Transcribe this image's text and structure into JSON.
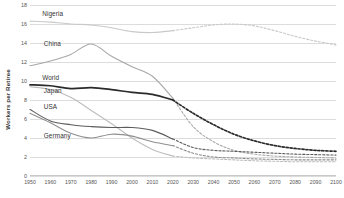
{
  "chart_data": {
    "type": "line",
    "title": "",
    "subtitle": "",
    "xlabel": "",
    "ylabel": "Workers per Retiree",
    "xlim": [
      1950,
      2100
    ],
    "ylim": [
      0,
      18
    ],
    "yticks": [
      0,
      2,
      4,
      6,
      8,
      10,
      12,
      14,
      16,
      18
    ],
    "xticks": [
      1950,
      1960,
      1970,
      1980,
      1990,
      2000,
      2010,
      2020,
      2030,
      2040,
      2050,
      2060,
      2070,
      2080,
      2090,
      2100
    ],
    "grid": "horizontal",
    "legend_position": "inline-labels",
    "projection_note": "Solid segments are historical (1950-2020); dashed segments are projections (2020-2100).",
    "x": [
      1950,
      1960,
      1970,
      1980,
      1990,
      2000,
      2010,
      2020,
      2030,
      2040,
      2050,
      2060,
      2070,
      2080,
      2090,
      2100
    ],
    "series": [
      {
        "name": "Nigeria",
        "color": "#c9c9c9",
        "label_x_pct": 4.0,
        "label_y_value": 17.1,
        "historical_end_year": 2020,
        "values": [
          16.3,
          16.2,
          16.0,
          15.9,
          15.6,
          15.2,
          15.1,
          15.3,
          15.6,
          15.9,
          16.0,
          15.8,
          15.3,
          14.7,
          14.2,
          13.8
        ]
      },
      {
        "name": "China",
        "color": "#a8a8a8",
        "label_x_pct": 4.5,
        "label_y_value": 13.9,
        "historical_end_year": 2020,
        "values": [
          11.6,
          12.1,
          12.8,
          13.9,
          12.6,
          11.5,
          10.5,
          8.2,
          5.2,
          3.6,
          2.7,
          2.3,
          2.1,
          2.0,
          1.95,
          1.9
        ]
      },
      {
        "name": "World",
        "color": "#2b2b2b",
        "label_x_pct": 4.0,
        "label_y_value": 10.3,
        "historical_end_year": 2020,
        "values": [
          9.6,
          9.5,
          9.2,
          9.3,
          9.1,
          8.8,
          8.6,
          8.0,
          6.6,
          5.4,
          4.4,
          3.7,
          3.2,
          2.9,
          2.7,
          2.6
        ]
      },
      {
        "name": "Japan",
        "color": "#bdbdbd",
        "label_x_pct": 4.5,
        "label_y_value": 9.0,
        "historical_end_year": 2020,
        "values": [
          9.4,
          9.1,
          8.3,
          6.9,
          5.5,
          4.0,
          2.8,
          2.1,
          1.9,
          1.8,
          1.7,
          1.6,
          1.55,
          1.5,
          1.5,
          1.5
        ]
      },
      {
        "name": "USA",
        "color": "#5c5c5c",
        "label_x_pct": 4.5,
        "label_y_value": 7.3,
        "historical_end_year": 2020,
        "values": [
          7.0,
          5.8,
          5.4,
          5.2,
          5.1,
          5.1,
          4.8,
          3.9,
          3.0,
          2.7,
          2.6,
          2.5,
          2.4,
          2.3,
          2.25,
          2.2
        ]
      },
      {
        "name": "Germany",
        "color": "#8f8f8f",
        "label_x_pct": 4.5,
        "label_y_value": 4.2,
        "historical_end_year": 2020,
        "values": [
          6.6,
          5.6,
          4.5,
          4.0,
          4.4,
          4.2,
          3.6,
          3.2,
          2.4,
          2.0,
          1.9,
          1.8,
          1.75,
          1.7,
          1.7,
          1.7
        ]
      }
    ]
  }
}
